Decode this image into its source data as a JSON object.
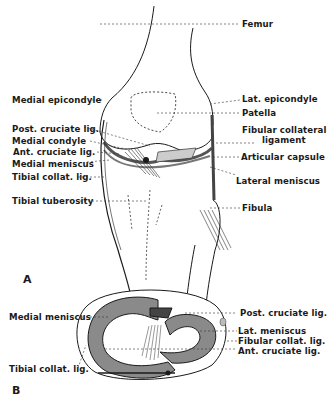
{
  "figure": {
    "panel_a": {
      "letter": "A",
      "view": "Anterior view of knee joint",
      "labels_left": [
        {
          "text": "Medial epicondyle"
        },
        {
          "text": "Post. cruciate lig."
        },
        {
          "text": "Medial condyle"
        },
        {
          "text": "Ant. cruciate lig."
        },
        {
          "text": "Medial meniscus"
        },
        {
          "text": "Tibial collat. lig."
        },
        {
          "text": "Tibial tuberosity"
        }
      ],
      "labels_right": [
        {
          "text": "Femur"
        },
        {
          "text": "Lat. epicondyle"
        },
        {
          "text": "Patella"
        },
        {
          "text": "Fibular collateral"
        },
        {
          "text": "ligament"
        },
        {
          "text": "Articular capsule"
        },
        {
          "text": "Lateral meniscus"
        },
        {
          "text": "Fibula"
        }
      ]
    },
    "panel_b": {
      "letter": "B",
      "view": "Superior view of tibial plateau",
      "labels_left": [
        {
          "text": "Medial meniscus"
        },
        {
          "text": "Tibial collat. lig."
        }
      ],
      "labels_right": [
        {
          "text": "Post. cruciate lig."
        },
        {
          "text": "Lat. meniscus"
        },
        {
          "text": "Fibular collat. lig."
        },
        {
          "text": "Ant. cruciate lig."
        }
      ]
    },
    "colors": {
      "ink": "#1a1a1a",
      "meniscus_fill": "#8a8a8a",
      "background": "#ffffff"
    }
  }
}
